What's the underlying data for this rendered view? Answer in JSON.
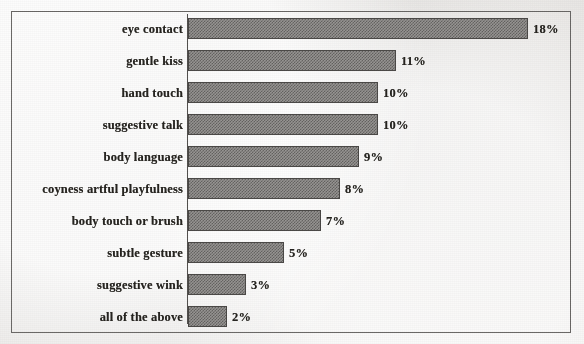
{
  "chart_data": {
    "type": "bar",
    "orientation": "horizontal",
    "title": "",
    "subtitle": "",
    "xlabel": "",
    "ylabel": "",
    "grid": false,
    "legend": "none",
    "axis_line": "category-axis-left",
    "value_label_suffix": "%",
    "xlim": [
      0,
      20
    ],
    "categories": [
      "eye contact",
      "gentle kiss",
      "hand touch",
      "suggestive talk",
      "body language",
      "coyness artful playfulness",
      "body touch or brush",
      "subtle gesture",
      "suggestive wink",
      "all of the above"
    ],
    "values": [
      18,
      11,
      10,
      10,
      9,
      8,
      7,
      5,
      3,
      2
    ],
    "data_labels": [
      "18%",
      "11%",
      "10%",
      "10%",
      "9%",
      "8%",
      "7%",
      "5%",
      "3%",
      "2%"
    ]
  },
  "style": {
    "page_background": "#efedeb",
    "frame_border_color": "#5f5d5b",
    "axis_color": "#45423f",
    "bar_fill_color": "#8f8d8b",
    "bar_pattern_color": "#5a5856",
    "bar_border_color": "#3c3a38",
    "text_color": "#16140f"
  }
}
